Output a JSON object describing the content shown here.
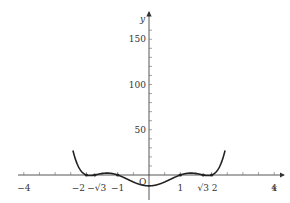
{
  "chart_data": {
    "type": "line",
    "title": "",
    "function": "y = (x^2 - 1)(x^2 - 3)(x^2 - 4)",
    "xlabel": "x",
    "ylabel": "y",
    "origin_label": "O",
    "x_ticks": [
      {
        "value": -4,
        "label": "−4"
      },
      {
        "value": -2,
        "label": "−2"
      },
      {
        "value": -1.732,
        "label": "−√3"
      },
      {
        "value": -1,
        "label": "−1"
      },
      {
        "value": 1,
        "label": "1"
      },
      {
        "value": 1.732,
        "label": "√3"
      },
      {
        "value": 2,
        "label": "2"
      },
      {
        "value": 4,
        "label": "4"
      }
    ],
    "y_ticks": [
      {
        "value": 50,
        "label": "50"
      },
      {
        "value": 100,
        "label": "100"
      },
      {
        "value": 150,
        "label": "150"
      }
    ],
    "xlim": [
      -4.3,
      4.6
    ],
    "ylim": [
      -15,
      175
    ],
    "roots": [
      -2,
      -1.732,
      -1,
      1,
      1.732,
      2
    ],
    "marked_points": [
      [
        -2,
        0
      ],
      [
        -1.732,
        0
      ],
      [
        -1,
        0
      ],
      [
        1,
        0
      ],
      [
        1.732,
        0
      ],
      [
        2,
        0
      ]
    ],
    "grid": false,
    "legend": "none"
  }
}
